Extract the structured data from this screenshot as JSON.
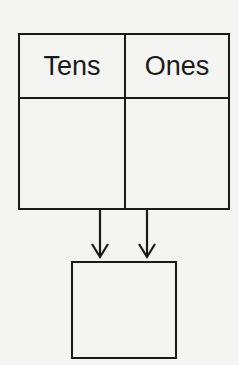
{
  "diagram": {
    "type": "place-value-chart",
    "columns": [
      {
        "header": "Tens",
        "value": ""
      },
      {
        "header": "Ones",
        "value": ""
      }
    ],
    "arrows": [
      {
        "from": "tens-cell",
        "to": "result-box"
      },
      {
        "from": "ones-cell",
        "to": "result-box"
      }
    ],
    "result": {
      "value": ""
    },
    "colors": {
      "line": "#1a1a1a",
      "background": "#f4f4f2"
    }
  }
}
